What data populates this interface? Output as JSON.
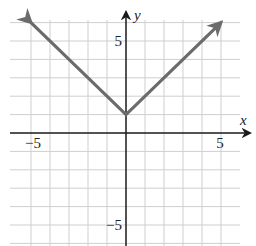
{
  "chart_data": {
    "type": "line",
    "title": "",
    "xlabel": "x",
    "ylabel": "y",
    "xlim": [
      -6,
      6
    ],
    "ylim": [
      -6,
      6
    ],
    "grid": true,
    "tick_labels": {
      "x": [
        {
          "value": -5,
          "label": "−5"
        },
        {
          "value": 5,
          "label": "5"
        }
      ],
      "y": [
        {
          "value": 5,
          "label": "5"
        },
        {
          "value": -5,
          "label": "−5"
        }
      ]
    },
    "series": [
      {
        "name": "y = |x| + 1",
        "x": [
          -5,
          0,
          5
        ],
        "y": [
          6,
          1,
          6
        ],
        "arrows_at_ends": true,
        "color": "#6b6b6b"
      }
    ]
  },
  "colors": {
    "grid": "#cfcfcf",
    "axis": "#1a1a1a",
    "curve": "#6b6b6b"
  }
}
